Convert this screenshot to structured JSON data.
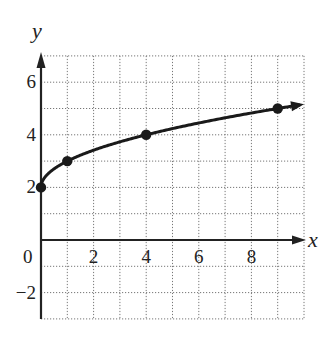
{
  "chart_data": {
    "type": "line",
    "title": "",
    "xlabel": "x",
    "ylabel": "y",
    "xlim": [
      0,
      10
    ],
    "ylim": [
      -3,
      7
    ],
    "grid": true,
    "grid_style": "dotted",
    "x_ticks": [
      {
        "value": 0,
        "label": "0"
      },
      {
        "value": 2,
        "label": "2"
      },
      {
        "value": 4,
        "label": "4"
      },
      {
        "value": 6,
        "label": "6"
      },
      {
        "value": 8,
        "label": "8"
      }
    ],
    "y_ticks": [
      {
        "value": 6,
        "label": "6"
      },
      {
        "value": 4,
        "label": "4"
      },
      {
        "value": 2,
        "label": "2"
      },
      {
        "value": -2,
        "label": "−2"
      }
    ],
    "series": [
      {
        "name": "y = √x + 2",
        "function": "sqrt(x)+2",
        "x": [
          0,
          1,
          4,
          9
        ],
        "y": [
          2,
          3,
          4,
          5
        ],
        "marked_points": [
          [
            0,
            2
          ],
          [
            1,
            3
          ],
          [
            4,
            4
          ],
          [
            9,
            5
          ]
        ],
        "arrow_end": true,
        "color": "#1a1a1a"
      }
    ],
    "legend": null
  }
}
